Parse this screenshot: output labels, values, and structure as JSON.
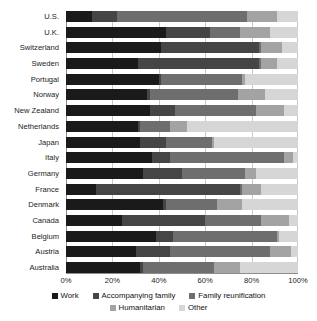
{
  "chart_data": {
    "type": "bar",
    "subtype": "horizontal-stacked-100",
    "title": "",
    "xlabel": "",
    "ylabel": "",
    "xlim": [
      0,
      100
    ],
    "xticks": [
      0,
      20,
      40,
      60,
      80,
      100
    ],
    "xticklabels": [
      "0%",
      "20%",
      "40%",
      "60%",
      "80%",
      "100%"
    ],
    "grid": true,
    "legend_position": "bottom",
    "categories": [
      "U.S.",
      "U.K.",
      "Switzerland",
      "Sweden",
      "Portugal",
      "Norway",
      "New Zealand",
      "Netherlands",
      "Japan",
      "Italy",
      "Germany",
      "France",
      "Denmark",
      "Canada",
      "Belgium",
      "Austria",
      "Australia"
    ],
    "series": [
      {
        "name": "Work",
        "color": "#1a1a1a",
        "values": [
          11,
          43,
          41,
          31,
          40,
          35,
          36,
          31,
          32,
          37,
          33,
          13,
          42,
          24,
          39,
          30,
          32
        ]
      },
      {
        "name": "Accompanying family",
        "color": "#454545",
        "values": [
          11,
          19,
          42,
          52,
          1,
          1,
          11,
          1,
          11,
          8,
          17,
          62,
          1,
          36,
          7,
          15,
          1
        ]
      },
      {
        "name": "Family reunification",
        "color": "#6e6e6e",
        "values": [
          56,
          13,
          1,
          1,
          35,
          38,
          35,
          13,
          20,
          49,
          27,
          1,
          22,
          24,
          45,
          43,
          31
        ]
      },
      {
        "name": "Humanitarian",
        "color": "#a3a3a3",
        "values": [
          13,
          13,
          9,
          7,
          1,
          12,
          12,
          7,
          1,
          4,
          5,
          8,
          11,
          12,
          1,
          9,
          11
        ]
      },
      {
        "name": "Other",
        "color": "#d6d6d6",
        "values": [
          9,
          12,
          7,
          9,
          23,
          14,
          6,
          48,
          36,
          2,
          18,
          16,
          24,
          4,
          8,
          3,
          25
        ]
      }
    ]
  },
  "legend": {
    "row1": [
      {
        "label": "Work",
        "color": "#1a1a1a"
      },
      {
        "label": "Accompanying family",
        "color": "#454545"
      },
      {
        "label": "Family reunification",
        "color": "#6e6e6e"
      }
    ],
    "row2": [
      {
        "label": "Humanitarian",
        "color": "#a3a3a3"
      },
      {
        "label": "Other",
        "color": "#d6d6d6"
      }
    ]
  }
}
